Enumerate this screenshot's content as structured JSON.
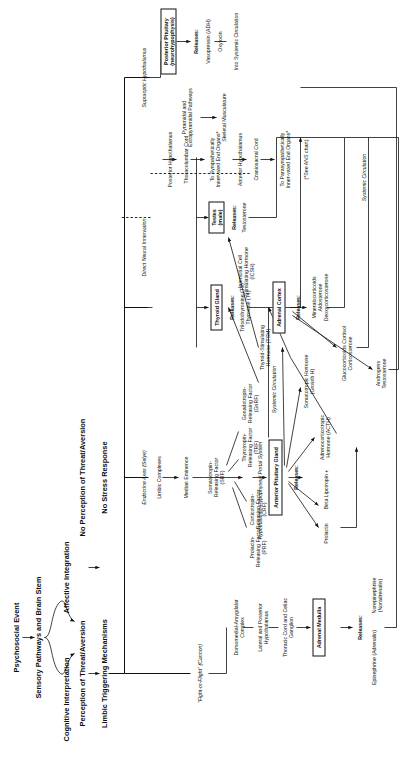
{
  "diagram": {
    "header": {
      "l1": "Psychosocial Event",
      "l2": "Sensory Pathways and Brain Stem",
      "l3a": "Cognitive Interpretation",
      "l3b": "Affective Integration",
      "l4a": "Perception of Threat/Aversion",
      "l4b": "No Perception of Threat/Aversion",
      "l5a": "Limbic Triggering Mechanisms",
      "l5b": "No Stress Response"
    },
    "branch_labels": {
      "fight_flight": "\"Fight-or-Flight\" (Cannon)",
      "endocrine_axes": "Endocrine Axes (Selye)",
      "direct_neural": "Direct Neural Innervation"
    },
    "sympathetic_chain": [
      "Dorsomedial-Amygdalar Complex",
      "Lateral and Posterior Hypothalamus",
      "Thoracic Cord and Celiac Ganglion"
    ],
    "adrenal_medulla": {
      "box": "Adrenal Medulla",
      "releases_label": "Releases:",
      "hormones": [
        "Epinephrine (Adrenalin)",
        "Norepinephrine (Noradrenalin)"
      ]
    },
    "limbic_chain": [
      "Limbic Complexes",
      "Median Eminence"
    ],
    "releasing_factors": [
      "Prolactin-Releasing Factor (PRF)",
      "Corticotropin-Releasing Factor (CRF)",
      "Somatotropin-Releasing Factor (SRF)",
      "Thyrotropin-Releasing Factor (TRF)",
      "Gonadotropin-Releasing Factor (GnRF)"
    ],
    "portal_system": "Hypothalamic-Hypophyseal Portal System",
    "anterior_pituitary": {
      "box": "Anterior Pituitary Gland",
      "releases_label": "Releases:",
      "hormones": [
        "Prolactin",
        "Beta Lipotropin +",
        "Adrenocorticotropic Hormone (ACTH)",
        "Somatotropic Hormone (Growth H)",
        "Thyroid-Stimulating Hormone (TSM)",
        "Interstitial Cell Stimulating Hormone (ICSH)"
      ]
    },
    "systemic_circulation": "Systemic Circulation",
    "adrenal_cortex": {
      "box": "Adrenal Cortex",
      "releases_label": "Releases:",
      "groups": [
        "Mineralocorticoids Aldosterone Deoxycorticosterone",
        "Glucocorticoids Cortisol Corticosterone",
        "Androgens Testosterone"
      ],
      "outflow": "Systemic Circulation"
    },
    "thyroid": {
      "box": "Thyroid Gland",
      "releases_label": "Releases:",
      "hormones": "Triiodothyronine (T3) Thyroxine (T4)"
    },
    "testes": {
      "box": "Testes (male)",
      "releases_label": "Releases:",
      "hormones": "Testosterone"
    },
    "neural_column": {
      "posterior_hypothalamus": "Posterior Hypothalamus",
      "thoracolumbar_cord": "Thoracolumbar Cord",
      "sympathetic_organs": "To Sympathetically Innervated End Organs*",
      "anterior_hypothalamus": "Anterior Hypothalamus",
      "craniosacral_cord": "Craniosacral Cord",
      "parasympathetic_organs": "To Parasympathetically Inner-vated End Organs*",
      "ans_note": "(*See ANS chart)",
      "pyramidal": "Pyramidal and Extrapyramidal Pathways",
      "skeletal": "Skeletal Musculature"
    },
    "posterior_pituitary": {
      "supraoptic": "Supraoptic Hypothalamus",
      "box": "Posterior Pituitary (neurohypophysis)",
      "releases_label": "Releases:",
      "hormones": [
        "Vasopressin (ADH)",
        "Oxytocin"
      ],
      "outflow": "Into Systemic Circulation"
    }
  }
}
